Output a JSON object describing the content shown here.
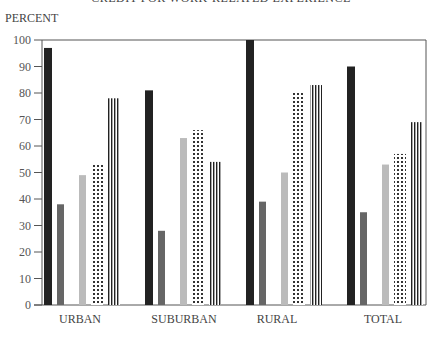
{
  "chart_data": {
    "type": "bar",
    "title": "CREDIT FOR WORK-RELATED EXPERIENCE",
    "xlabel": "",
    "ylabel": "PERCENT",
    "ylim": [
      0,
      100
    ],
    "yticks": [
      0,
      10,
      20,
      30,
      40,
      50,
      60,
      70,
      80,
      90,
      100
    ],
    "grid": false,
    "legend": "none",
    "categories": [
      "URBAN",
      "SUBURBAN",
      "RURAL",
      "TOTAL"
    ],
    "series": [
      {
        "name": "Series 1",
        "style": "solid-dark",
        "color": "#222222",
        "values": [
          97,
          81,
          100,
          90
        ]
      },
      {
        "name": "Series 2",
        "style": "solid-medium",
        "color": "#666666",
        "values": [
          38,
          28,
          39,
          35
        ]
      },
      {
        "name": "Series 3",
        "style": "solid-light",
        "color": "#bbbbbb",
        "values": [
          49,
          63,
          50,
          53
        ]
      },
      {
        "name": "Series 4",
        "style": "dotted",
        "color": "#333333",
        "values": [
          53,
          66,
          80,
          57
        ]
      },
      {
        "name": "Series 5",
        "style": "vertical-stripes",
        "color": "#222222",
        "values": [
          78,
          54,
          83,
          69
        ]
      }
    ]
  }
}
